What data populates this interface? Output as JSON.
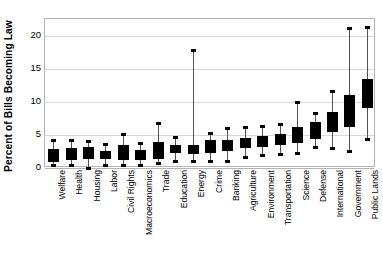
{
  "chart_data": {
    "type": "box",
    "title": "",
    "xlabel": "",
    "ylabel": "Percent of Bills Becoming Law",
    "ylim": [
      0,
      22.5
    ],
    "yticks": [
      0,
      5,
      10,
      15,
      20
    ],
    "ytick_labels": [
      "0",
      "5",
      "10",
      "15",
      "20"
    ],
    "grid": true,
    "legend": "none",
    "categories": [
      "Welfare",
      "Health",
      "Housing",
      "Labor",
      "Civil Rights",
      "Macroeconomics",
      "Trade",
      "Education",
      "Energy",
      "Crime",
      "Banking",
      "Agriculture",
      "Environment",
      "Transportation",
      "Science",
      "Defense",
      "International",
      "Government",
      "Public Lands"
    ],
    "boxes": [
      {
        "category": "Welfare",
        "whisker_low": 0.5,
        "q1": 0.9,
        "q3": 2.9,
        "whisker_high": 4.3
      },
      {
        "category": "Health",
        "whisker_low": 0.4,
        "q1": 1.2,
        "q3": 3.0,
        "whisker_high": 4.3
      },
      {
        "category": "Housing",
        "whisker_low": 0.0,
        "q1": 1.3,
        "q3": 3.1,
        "whisker_high": 4.1
      },
      {
        "category": "Labor",
        "whisker_low": 0.4,
        "q1": 1.4,
        "q3": 2.6,
        "whisker_high": 3.6
      },
      {
        "category": "Civil Rights",
        "whisker_low": 0.5,
        "q1": 1.2,
        "q3": 3.4,
        "whisker_high": 5.1
      },
      {
        "category": "Macroeconomics",
        "whisker_low": 0.5,
        "q1": 1.2,
        "q3": 2.7,
        "whisker_high": 3.7
      },
      {
        "category": "Trade",
        "whisker_low": 0.8,
        "q1": 1.3,
        "q3": 3.9,
        "whisker_high": 6.8
      },
      {
        "category": "Education",
        "whisker_low": 1.1,
        "q1": 2.2,
        "q3": 3.5,
        "whisker_high": 4.7
      },
      {
        "category": "Energy",
        "whisker_low": 1.0,
        "q1": 2.1,
        "q3": 3.5,
        "whisker_high": 17.8
      },
      {
        "category": "Crime",
        "whisker_low": 1.1,
        "q1": 2.3,
        "q3": 4.2,
        "whisker_high": 5.3
      },
      {
        "category": "Banking",
        "whisker_low": 1.0,
        "q1": 2.5,
        "q3": 4.3,
        "whisker_high": 6.0
      },
      {
        "category": "Agriculture",
        "whisker_low": 1.6,
        "q1": 3.0,
        "q3": 4.6,
        "whisker_high": 6.2
      },
      {
        "category": "Environment",
        "whisker_low": 2.0,
        "q1": 3.2,
        "q3": 4.8,
        "whisker_high": 6.3
      },
      {
        "category": "Transportation",
        "whisker_low": 2.1,
        "q1": 3.4,
        "q3": 5.1,
        "whisker_high": 6.7
      },
      {
        "category": "Science",
        "whisker_low": 2.2,
        "q1": 3.8,
        "q3": 6.2,
        "whisker_high": 10.0
      },
      {
        "category": "Defense",
        "whisker_low": 3.1,
        "q1": 4.4,
        "q3": 6.9,
        "whisker_high": 8.3
      },
      {
        "category": "International",
        "whisker_low": 3.0,
        "q1": 5.4,
        "q3": 8.5,
        "whisker_high": 11.6
      },
      {
        "category": "Government",
        "whisker_low": 2.5,
        "q1": 6.2,
        "q3": 11.0,
        "whisker_high": 21.1
      },
      {
        "category": "Public Lands",
        "whisker_low": 4.4,
        "q1": 9.0,
        "q3": 13.4,
        "whisker_high": 21.3
      }
    ]
  },
  "style": {
    "box_fill": "#000000",
    "whisker_color": "#555555",
    "grid_color": "#d8d8d8",
    "frame_color": "#b4b4b4",
    "background": "#ffffff"
  }
}
